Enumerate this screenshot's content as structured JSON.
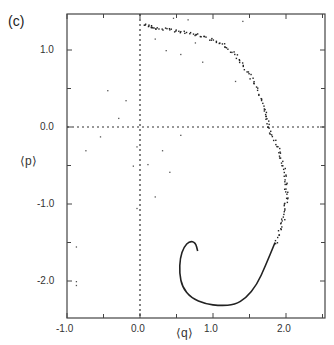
{
  "panel_label": "(c)",
  "chart_data": {
    "type": "scatter",
    "title": "",
    "xlabel": "⟨q⟩",
    "ylabel": "⟨p⟩",
    "xlim": [
      -1.0,
      2.53
    ],
    "ylim": [
      -2.48,
      1.47
    ],
    "xticks": [
      -1.0,
      0.0,
      1.0,
      2.0
    ],
    "xtick_labels": [
      "-1.0",
      "0.0",
      "1.0",
      "2.0"
    ],
    "yticks": [
      1.0,
      0.0,
      -1.0,
      -2.0
    ],
    "ytick_labels": [
      "1.0",
      "0.0",
      "-1.0",
      "-2.0"
    ],
    "reference_lines": {
      "x": 0.0,
      "y": 0.0,
      "style": "dotted"
    },
    "grid": false,
    "legend": null,
    "series": [
      {
        "name": "trajectory (solid spiral)",
        "style": "line",
        "points": [
          [
            0.79,
            -1.61
          ],
          [
            0.76,
            -1.5
          ],
          [
            0.68,
            -1.48
          ],
          [
            0.6,
            -1.56
          ],
          [
            0.55,
            -1.7
          ],
          [
            0.54,
            -1.9
          ],
          [
            0.58,
            -2.08
          ],
          [
            0.7,
            -2.22
          ],
          [
            0.9,
            -2.3
          ],
          [
            1.1,
            -2.32
          ],
          [
            1.3,
            -2.31
          ],
          [
            1.45,
            -2.22
          ],
          [
            1.6,
            -2.05
          ],
          [
            1.72,
            -1.8
          ],
          [
            1.85,
            -1.5
          ]
        ]
      },
      {
        "name": "trajectory (dotted outer arc)",
        "style": "points",
        "points": [
          [
            1.85,
            -1.5
          ],
          [
            1.95,
            -1.2
          ],
          [
            2.0,
            -0.9
          ],
          [
            1.98,
            -0.6
          ],
          [
            1.9,
            -0.3
          ],
          [
            1.75,
            0.0
          ],
          [
            1.7,
            0.25
          ],
          [
            1.55,
            0.6
          ],
          [
            1.35,
            0.9
          ],
          [
            1.1,
            1.1
          ],
          [
            0.8,
            1.2
          ],
          [
            0.5,
            1.25
          ],
          [
            0.2,
            1.3
          ],
          [
            0.05,
            1.33
          ]
        ]
      },
      {
        "name": "scattered points",
        "style": "points",
        "points": [
          [
            -0.75,
            -0.3
          ],
          [
            -0.55,
            -0.12
          ],
          [
            -0.3,
            0.12
          ],
          [
            -0.2,
            0.35
          ],
          [
            -0.45,
            0.48
          ],
          [
            -0.05,
            -0.25
          ],
          [
            -0.1,
            -0.5
          ],
          [
            0.1,
            -0.48
          ],
          [
            0.3,
            -0.3
          ],
          [
            0.4,
            -0.58
          ],
          [
            0.55,
            -0.1
          ],
          [
            0.2,
            -0.9
          ],
          [
            -0.05,
            -1.05
          ],
          [
            -0.88,
            -1.55
          ],
          [
            -0.88,
            -2.0
          ],
          [
            -0.88,
            -2.05
          ],
          [
            0.2,
            1.15
          ],
          [
            0.35,
            1.0
          ],
          [
            0.55,
            0.95
          ],
          [
            0.75,
            1.1
          ],
          [
            0.85,
            0.85
          ],
          [
            1.3,
            0.6
          ],
          [
            1.4,
            1.38
          ],
          [
            0.45,
            1.42
          ],
          [
            0.65,
            1.4
          ]
        ]
      }
    ]
  },
  "colors": {
    "line": "#222222",
    "axis": "#444444",
    "text": "#333333"
  }
}
